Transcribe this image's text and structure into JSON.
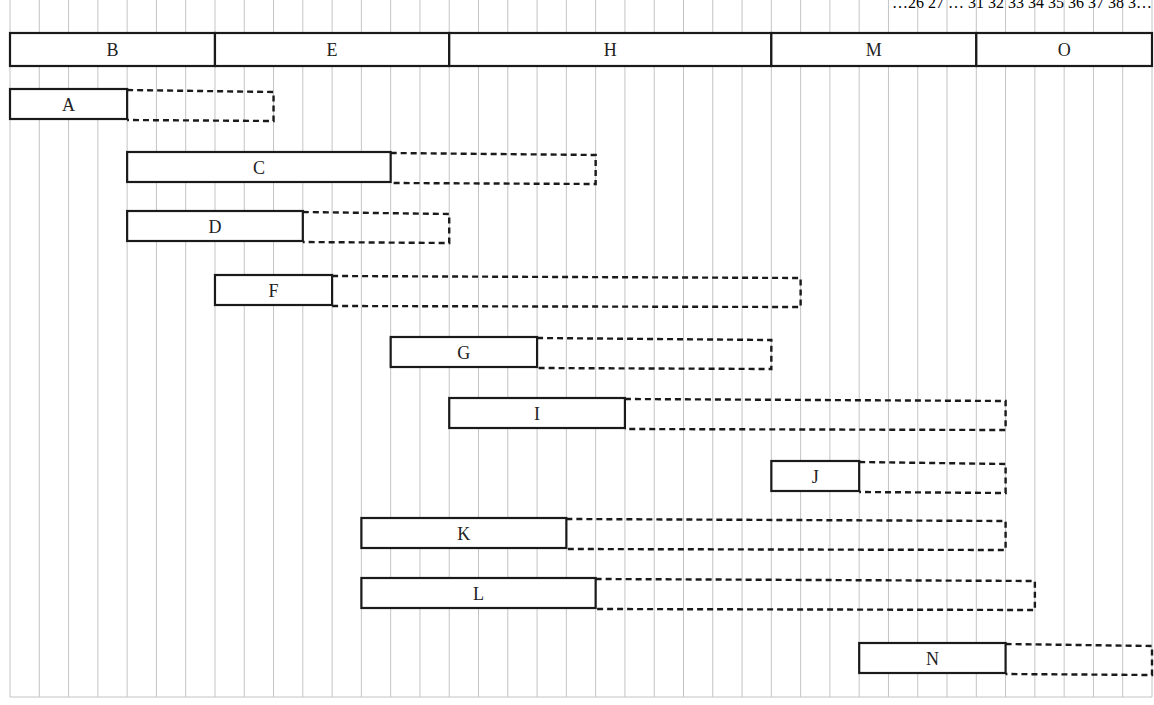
{
  "chart_data": {
    "type": "gantt",
    "title": "",
    "xlabel": "",
    "ylabel": "",
    "unit": "grid column (time period)",
    "x_range": [
      0,
      39
    ],
    "grid": true,
    "header_digits_partial": "…26 27 … 31 32 33 34 35 36 37 38 3…",
    "critical_path": [
      {
        "label": "B",
        "start": 0,
        "end": 7
      },
      {
        "label": "E",
        "start": 7,
        "end": 15
      },
      {
        "label": "H",
        "start": 15,
        "end": 26
      },
      {
        "label": "M",
        "start": 26,
        "end": 33
      },
      {
        "label": "O",
        "start": 33,
        "end": 39
      }
    ],
    "tasks": [
      {
        "label": "A",
        "start": 0,
        "end": 4,
        "float_end": 9
      },
      {
        "label": "C",
        "start": 4,
        "end": 13,
        "float_end": 20
      },
      {
        "label": "D",
        "start": 4,
        "end": 10,
        "float_end": 15
      },
      {
        "label": "F",
        "start": 7,
        "end": 11,
        "float_end": 27
      },
      {
        "label": "G",
        "start": 13,
        "end": 18,
        "float_end": 26
      },
      {
        "label": "I",
        "start": 15,
        "end": 21,
        "float_end": 34
      },
      {
        "label": "J",
        "start": 26,
        "end": 29,
        "float_end": 34
      },
      {
        "label": "K",
        "start": 12,
        "end": 19,
        "float_end": 34
      },
      {
        "label": "L",
        "start": 12,
        "end": 20,
        "float_end": 35
      },
      {
        "label": "N",
        "start": 29,
        "end": 34,
        "float_end": 39
      }
    ],
    "legend": {
      "solid_bar": "activity duration",
      "dashed_bar": "float"
    }
  },
  "colors": {
    "grid": "#c4c4c4",
    "bar_stroke": "#1a1a1a",
    "text": "#222222",
    "background": "#ffffff"
  }
}
